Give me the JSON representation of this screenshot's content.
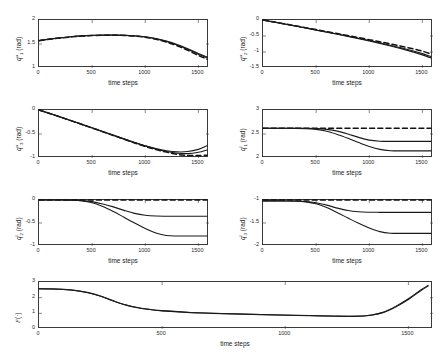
{
  "figure": {
    "background": "#ffffff",
    "axis_color": "#3a3a3a",
    "solid_color": "#1a1a1a",
    "dashed_color": "#111111",
    "x_label": "time steps",
    "x_ticks": [
      "0",
      "500",
      "1000",
      "1500"
    ],
    "x_range": [
      0,
      1600
    ],
    "x_tick_values": [
      0,
      500,
      1000,
      1500
    ]
  },
  "chart_data": [
    {
      "id": "q1-upper",
      "type": "line",
      "title": "",
      "xlabel": "time steps",
      "ylabel": "q^u_1 (rad)",
      "ylabel_base": "q",
      "ylabel_sup": "u",
      "ylabel_sub": "1",
      "ylabel_unit": "(rad)",
      "xlim": [
        0,
        1600
      ],
      "ylim": [
        1,
        2
      ],
      "yticks": [
        1,
        1.5,
        2
      ],
      "ytick_labels": [
        "1",
        "1.5",
        "2"
      ],
      "grid": false,
      "x": [
        0,
        100,
        200,
        300,
        400,
        500,
        600,
        700,
        800,
        900,
        1000,
        1100,
        1200,
        1300,
        1400,
        1500,
        1580
      ],
      "series": [
        {
          "name": "reference",
          "style": "dashed",
          "values": [
            1.57,
            1.6,
            1.625,
            1.648,
            1.665,
            1.675,
            1.681,
            1.682,
            1.678,
            1.665,
            1.64,
            1.598,
            1.54,
            1.462,
            1.368,
            1.262,
            1.185
          ]
        },
        {
          "name": "actual-1",
          "style": "solid",
          "values": [
            1.57,
            1.601,
            1.627,
            1.65,
            1.667,
            1.677,
            1.683,
            1.684,
            1.68,
            1.668,
            1.645,
            1.606,
            1.551,
            1.477,
            1.388,
            1.288,
            1.215
          ]
        },
        {
          "name": "actual-2",
          "style": "solid",
          "values": [
            1.572,
            1.603,
            1.629,
            1.652,
            1.669,
            1.679,
            1.685,
            1.686,
            1.683,
            1.672,
            1.65,
            1.613,
            1.56,
            1.489,
            1.402,
            1.303,
            1.232
          ]
        }
      ]
    },
    {
      "id": "q2-upper",
      "type": "line",
      "xlabel": "time steps",
      "ylabel": "q^u_2 (rad)",
      "ylabel_base": "q",
      "ylabel_sup": "u",
      "ylabel_sub": "2",
      "ylabel_unit": "(rad)",
      "xlim": [
        0,
        1600
      ],
      "ylim": [
        -1.5,
        0
      ],
      "yticks": [
        -1.5,
        -1,
        -0.5,
        0
      ],
      "ytick_labels": [
        "-1.5",
        "-1",
        "-0.5",
        "0"
      ],
      "grid": false,
      "x": [
        0,
        100,
        200,
        300,
        400,
        500,
        600,
        700,
        800,
        900,
        1000,
        1100,
        1200,
        1300,
        1400,
        1500,
        1580
      ],
      "series": [
        {
          "name": "reference",
          "style": "dashed",
          "values": [
            0.0,
            -0.058,
            -0.118,
            -0.178,
            -0.238,
            -0.3,
            -0.362,
            -0.424,
            -0.487,
            -0.55,
            -0.615,
            -0.68,
            -0.748,
            -0.818,
            -0.892,
            -0.975,
            -1.06
          ]
        },
        {
          "name": "actual-1",
          "style": "solid",
          "values": [
            0.0,
            -0.06,
            -0.122,
            -0.184,
            -0.246,
            -0.31,
            -0.374,
            -0.438,
            -0.503,
            -0.57,
            -0.64,
            -0.712,
            -0.788,
            -0.868,
            -0.955,
            -1.05,
            -1.14
          ]
        },
        {
          "name": "actual-2",
          "style": "solid",
          "values": [
            -0.004,
            -0.064,
            -0.126,
            -0.189,
            -0.252,
            -0.316,
            -0.381,
            -0.447,
            -0.514,
            -0.583,
            -0.655,
            -0.73,
            -0.81,
            -0.895,
            -0.988,
            -1.09,
            -1.185
          ]
        }
      ]
    },
    {
      "id": "q3-upper",
      "type": "line",
      "xlabel": "time steps",
      "ylabel": "q^u_3 (rad)",
      "ylabel_base": "q",
      "ylabel_sup": "u",
      "ylabel_sub": "3",
      "ylabel_unit": "(rad)",
      "xlim": [
        0,
        1600
      ],
      "ylim": [
        -1,
        0
      ],
      "yticks": [
        -1,
        -0.5,
        0
      ],
      "ytick_labels": [
        "-1",
        "-0.5",
        "0"
      ],
      "grid": false,
      "x": [
        0,
        100,
        200,
        300,
        400,
        500,
        600,
        700,
        800,
        900,
        1000,
        1100,
        1200,
        1300,
        1400,
        1500,
        1580
      ],
      "series": [
        {
          "name": "reference",
          "style": "dashed",
          "values": [
            0.0,
            -0.072,
            -0.146,
            -0.222,
            -0.298,
            -0.375,
            -0.452,
            -0.53,
            -0.608,
            -0.686,
            -0.76,
            -0.825,
            -0.878,
            -0.925,
            -0.948,
            -0.948,
            -0.942
          ]
        },
        {
          "name": "actual-1",
          "style": "solid",
          "values": [
            0.0,
            -0.07,
            -0.143,
            -0.218,
            -0.293,
            -0.369,
            -0.446,
            -0.523,
            -0.6,
            -0.676,
            -0.748,
            -0.812,
            -0.864,
            -0.9,
            -0.908,
            -0.88,
            -0.832
          ]
        },
        {
          "name": "actual-2",
          "style": "solid",
          "values": [
            -0.003,
            -0.074,
            -0.148,
            -0.224,
            -0.3,
            -0.377,
            -0.454,
            -0.531,
            -0.607,
            -0.68,
            -0.748,
            -0.805,
            -0.848,
            -0.872,
            -0.866,
            -0.82,
            -0.745
          ]
        }
      ]
    },
    {
      "id": "q1-lower",
      "type": "line",
      "xlabel": "time steps",
      "ylabel": "q^l_1 (rad)",
      "ylabel_base": "q",
      "ylabel_sup": "l",
      "ylabel_sub": "1",
      "ylabel_unit": "(rad)",
      "xlim": [
        0,
        1600
      ],
      "ylim": [
        2,
        3
      ],
      "yticks": [
        2,
        2.5,
        3
      ],
      "ytick_labels": [
        "2",
        "2.5",
        "3"
      ],
      "grid": false,
      "x": [
        0,
        100,
        200,
        300,
        400,
        500,
        600,
        700,
        800,
        900,
        1000,
        1100,
        1200,
        1300,
        1400,
        1500,
        1580
      ],
      "series": [
        {
          "name": "reference",
          "style": "dashed",
          "values": [
            2.62,
            2.62,
            2.62,
            2.62,
            2.62,
            2.62,
            2.62,
            2.62,
            2.62,
            2.62,
            2.62,
            2.62,
            2.62,
            2.62,
            2.62,
            2.62,
            2.62
          ]
        },
        {
          "name": "actual-1",
          "style": "solid",
          "values": [
            2.62,
            2.62,
            2.62,
            2.62,
            2.618,
            2.612,
            2.596,
            2.56,
            2.5,
            2.43,
            2.372,
            2.35,
            2.346,
            2.346,
            2.346,
            2.346,
            2.346
          ]
        },
        {
          "name": "actual-2",
          "style": "solid",
          "values": [
            2.62,
            2.62,
            2.62,
            2.618,
            2.612,
            2.596,
            2.556,
            2.49,
            2.41,
            2.322,
            2.24,
            2.18,
            2.152,
            2.148,
            2.148,
            2.148,
            2.148
          ]
        }
      ]
    },
    {
      "id": "q2-lower",
      "type": "line",
      "xlabel": "time steps",
      "ylabel": "q^l_2 (rad)",
      "ylabel_base": "q",
      "ylabel_sup": "l",
      "ylabel_sub": "2",
      "ylabel_unit": "(rad)",
      "xlim": [
        0,
        1600
      ],
      "ylim": [
        -1,
        0
      ],
      "yticks": [
        -1,
        -0.5,
        0
      ],
      "ytick_labels": [
        "-1",
        "-0.5",
        "0"
      ],
      "grid": false,
      "x": [
        0,
        100,
        200,
        300,
        400,
        500,
        600,
        700,
        800,
        900,
        1000,
        1100,
        1200,
        1300,
        1400,
        1500,
        1580
      ],
      "series": [
        {
          "name": "reference",
          "style": "dashed",
          "values": [
            0.0,
            0.0,
            0.0,
            0.0,
            0.0,
            0.0,
            0.0,
            0.0,
            0.0,
            0.0,
            0.0,
            0.0,
            0.0,
            0.0,
            0.0,
            0.0,
            0.0
          ]
        },
        {
          "name": "actual-1",
          "style": "solid",
          "values": [
            0.0,
            0.0,
            0.0,
            -0.002,
            -0.01,
            -0.035,
            -0.085,
            -0.15,
            -0.225,
            -0.29,
            -0.33,
            -0.348,
            -0.352,
            -0.352,
            -0.352,
            -0.352,
            -0.352
          ]
        },
        {
          "name": "actual-2",
          "style": "solid",
          "values": [
            0.0,
            0.0,
            0.0,
            -0.004,
            -0.018,
            -0.06,
            -0.14,
            -0.25,
            -0.375,
            -0.5,
            -0.62,
            -0.718,
            -0.772,
            -0.782,
            -0.782,
            -0.782,
            -0.782
          ]
        }
      ]
    },
    {
      "id": "q3-lower",
      "type": "line",
      "xlabel": "time steps",
      "ylabel": "q^l_3 (rad)",
      "ylabel_base": "q",
      "ylabel_sup": "l",
      "ylabel_sub": "3",
      "ylabel_unit": "(rad)",
      "xlim": [
        0,
        1600
      ],
      "ylim": [
        -2,
        -1
      ],
      "yticks": [
        -2,
        -1.5,
        -1
      ],
      "ytick_labels": [
        "-2",
        "-1.5",
        "-1"
      ],
      "grid": false,
      "x": [
        0,
        100,
        200,
        300,
        400,
        500,
        600,
        700,
        800,
        900,
        1000,
        1100,
        1200,
        1300,
        1400,
        1500,
        1580
      ],
      "series": [
        {
          "name": "reference",
          "style": "dashed",
          "values": [
            -1.0,
            -1.0,
            -1.0,
            -1.0,
            -1.0,
            -1.0,
            -1.0,
            -1.0,
            -1.0,
            -1.0,
            -1.0,
            -1.0,
            -1.0,
            -1.0,
            -1.0,
            -1.0,
            -1.0
          ]
        },
        {
          "name": "actual-1",
          "style": "solid",
          "values": [
            -1.02,
            -1.02,
            -1.02,
            -1.022,
            -1.032,
            -1.06,
            -1.112,
            -1.176,
            -1.228,
            -1.256,
            -1.266,
            -1.268,
            -1.268,
            -1.268,
            -1.268,
            -1.268,
            -1.268
          ]
        },
        {
          "name": "actual-2",
          "style": "solid",
          "values": [
            -1.02,
            -1.02,
            -1.02,
            -1.024,
            -1.04,
            -1.082,
            -1.165,
            -1.275,
            -1.392,
            -1.508,
            -1.61,
            -1.688,
            -1.722,
            -1.726,
            -1.726,
            -1.726,
            -1.726
          ]
        }
      ]
    },
    {
      "id": "cost-function",
      "type": "line",
      "xlabel": "time steps",
      "ylabel": "F (·)",
      "ylabel_base": "F",
      "ylabel_unit": "(·)",
      "xlim": [
        0,
        1600
      ],
      "ylim": [
        0,
        3
      ],
      "yticks": [
        0,
        1,
        2,
        3
      ],
      "ytick_labels": [
        "0",
        "1",
        "2",
        "3"
      ],
      "grid": false,
      "x": [
        0,
        50,
        100,
        150,
        200,
        250,
        300,
        350,
        400,
        450,
        500,
        600,
        700,
        800,
        900,
        1000,
        1100,
        1200,
        1250,
        1300,
        1350,
        1400,
        1450,
        1500,
        1550,
        1580
      ],
      "series": [
        {
          "name": "cost-1",
          "style": "solid",
          "values": [
            2.56,
            2.55,
            2.52,
            2.45,
            2.31,
            2.09,
            1.8,
            1.54,
            1.36,
            1.24,
            1.16,
            1.06,
            1.0,
            0.955,
            0.915,
            0.882,
            0.85,
            0.818,
            0.805,
            0.812,
            0.88,
            1.06,
            1.42,
            1.88,
            2.44,
            2.74
          ]
        },
        {
          "name": "cost-2",
          "style": "solid",
          "values": [
            2.57,
            2.56,
            2.53,
            2.46,
            2.32,
            2.1,
            1.81,
            1.55,
            1.37,
            1.25,
            1.17,
            1.07,
            1.01,
            0.965,
            0.925,
            0.892,
            0.86,
            0.828,
            0.815,
            0.824,
            0.898,
            1.09,
            1.46,
            1.93,
            2.49,
            2.78
          ]
        }
      ]
    }
  ]
}
